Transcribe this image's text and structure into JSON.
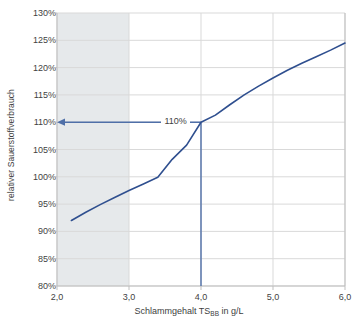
{
  "chart_data": {
    "type": "line",
    "title": "",
    "xlabel": "Schlammgehalt TS",
    "xlabel_sub": "BB",
    "xlabel_unit": " in g/L",
    "ylabel": "relativer Sauerstoffverbrauch",
    "xlim": [
      2.0,
      6.0
    ],
    "ylim": [
      0.8,
      1.3
    ],
    "grid": true,
    "legend": "none",
    "x_tick_labels": [
      "2,0",
      "3,0",
      "4,0",
      "5,0",
      "6,0"
    ],
    "x_tick_values": [
      2.0,
      3.0,
      4.0,
      5.0,
      6.0
    ],
    "y_tick_labels": [
      "80%",
      "85%",
      "90%",
      "95%",
      "100%",
      "105%",
      "110%",
      "115%",
      "120%",
      "125%",
      "130%"
    ],
    "y_tick_values": [
      0.8,
      0.85,
      0.9,
      0.95,
      1.0,
      1.05,
      1.1,
      1.15,
      1.2,
      1.25,
      1.3
    ],
    "series": [
      {
        "name": "relativer Sauerstoffverbrauch",
        "color": "#2f4f8f",
        "x": [
          2.2,
          2.4,
          2.6,
          2.8,
          3.0,
          3.2,
          3.4,
          3.6,
          3.8,
          4.0,
          4.2,
          4.4,
          4.6,
          4.8,
          5.0,
          5.2,
          5.4,
          5.6,
          5.8,
          6.0
        ],
        "values": [
          0.92,
          0.935,
          0.949,
          0.962,
          0.975,
          0.987,
          0.999,
          1.032,
          1.058,
          1.1,
          1.113,
          1.132,
          1.15,
          1.166,
          1.181,
          1.195,
          1.208,
          1.22,
          1.232,
          1.245
        ]
      }
    ],
    "shaded_band": {
      "name": "typischer Bereich",
      "x_start": 2.0,
      "x_end": 3.0,
      "color": "#e6e9eb"
    },
    "annotations": [
      {
        "name": "operating-point-label",
        "text": "110%",
        "x": 3.45,
        "y": 1.1
      }
    ],
    "guide_lines": [
      {
        "name": "vertical-guide",
        "x": 4.0,
        "y_from": 0.8,
        "y_to": 1.1,
        "color": "#4f6fa8"
      },
      {
        "name": "horizontal-arrow",
        "y": 1.1,
        "x_from": 4.0,
        "x_to": 2.0,
        "color": "#4f6fa8"
      }
    ],
    "colors": {
      "curve": "#2f4f8f",
      "guide": "#4f6fa8",
      "band": "#e6e9eb",
      "grid": "#d9d9d9",
      "axis": "#bfbfbf",
      "text": "#3f3f3f"
    }
  }
}
